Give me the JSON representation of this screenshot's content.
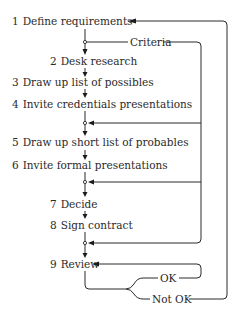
{
  "diagram": {
    "type": "flowchart",
    "steps": [
      {
        "num": "1",
        "label": "Define requirements"
      },
      {
        "num": "2",
        "label": "Desk research"
      },
      {
        "num": "3",
        "label": "Draw up list of possibles"
      },
      {
        "num": "4",
        "label": "Invite credentials presentations"
      },
      {
        "num": "5",
        "label": "Draw up short list of probables"
      },
      {
        "num": "6",
        "label": "Invite formal presentations"
      },
      {
        "num": "7",
        "label": "Decide"
      },
      {
        "num": "8",
        "label": "Sign contract"
      },
      {
        "num": "9",
        "label": "Review"
      }
    ],
    "feedback_labels": {
      "criteria": "Criteria",
      "ok": "OK",
      "not_ok": "Not OK"
    },
    "connections": [
      {
        "from": "1",
        "to": "2"
      },
      {
        "from": "2",
        "to": "3"
      },
      {
        "from": "3",
        "to": "4"
      },
      {
        "from": "4",
        "to": "5"
      },
      {
        "from": "5",
        "to": "6"
      },
      {
        "from": "6",
        "to": "7"
      },
      {
        "from": "7",
        "to": "8"
      },
      {
        "from": "8",
        "to": "9"
      },
      {
        "from": "criteria-junction",
        "to": "junction-after-4",
        "label": "Criteria"
      },
      {
        "from": "criteria-junction",
        "to": "junction-after-6",
        "label": "Criteria"
      },
      {
        "from": "criteria-junction",
        "to": "junction-after-8",
        "label": "Criteria"
      },
      {
        "from": "9",
        "to": "9",
        "label": "OK"
      },
      {
        "from": "9",
        "to": "1",
        "label": "Not OK"
      }
    ]
  }
}
